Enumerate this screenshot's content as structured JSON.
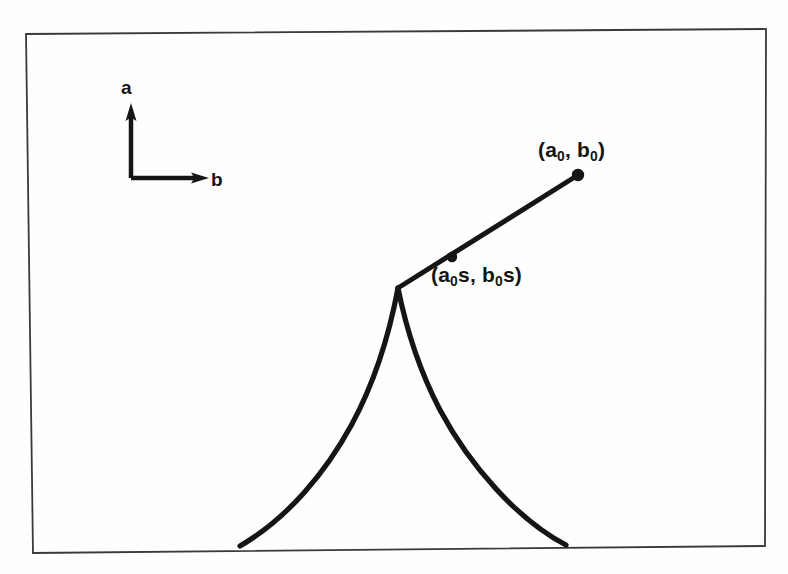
{
  "figure": {
    "type": "line-diagram",
    "background_color": "#fefefe",
    "stroke_color": "#151515",
    "frame": {
      "name": "figure-border",
      "corners": [
        [
          26,
          34
        ],
        [
          766,
          29
        ],
        [
          765,
          546
        ],
        [
          33,
          553
        ]
      ],
      "stroke_width": 1.6
    },
    "axes": {
      "origin": [
        131,
        178
      ],
      "vertical_axis": {
        "label": "a",
        "tip": [
          131,
          108
        ],
        "label_pos": [
          121,
          78
        ]
      },
      "horizontal_axis": {
        "label": "b",
        "tip": [
          206,
          178
        ],
        "label_pos": [
          211,
          170
        ]
      },
      "stroke_width": 4
    },
    "cusp": {
      "name": "cusp-apex",
      "apex": [
        398,
        288
      ],
      "left_branch_end": [
        240,
        546
      ],
      "right_branch_end": [
        566,
        545
      ],
      "stroke_width": 5
    },
    "ray": {
      "name": "ray-from-cusp",
      "start": [
        398,
        288
      ],
      "end": [
        578,
        175
      ],
      "stroke_width": 5
    },
    "points": [
      {
        "name": "point-a0-b0",
        "x": 578,
        "y": 175,
        "radius": 6,
        "label": "(a₀, b₀)",
        "label_main": "(a",
        "label_sub1": "0",
        "label_mid": ", b",
        "label_sub2": "0",
        "label_end": ")"
      },
      {
        "name": "point-a0s-b0s",
        "x": 452,
        "y": 257,
        "radius": 5,
        "label": "(a₀s, b₀s)",
        "label_main": "(a",
        "label_sub1": "0",
        "label_mid": "s, b",
        "label_sub2": "0",
        "label_end": "s)"
      }
    ]
  },
  "labels": {
    "axis_a": "a",
    "axis_b": "b",
    "point_top_prefix": "(a",
    "point_top_sub_1": "0",
    "point_top_middle": ", b",
    "point_top_sub_2": "0",
    "point_top_suffix": ")",
    "point_mid_prefix": "(a",
    "point_mid_sub_1": "0",
    "point_mid_middle": "s, b",
    "point_mid_sub_2": "0",
    "point_mid_suffix": "s)"
  }
}
